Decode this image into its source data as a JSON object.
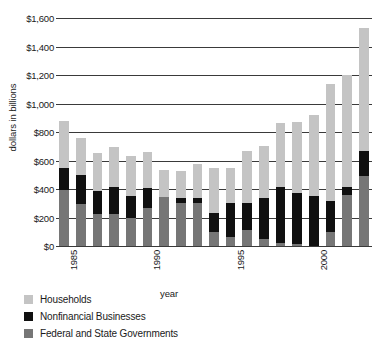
{
  "chart_data": {
    "type": "bar",
    "subtype": "stacked-bar",
    "title": "",
    "xlabel": "year",
    "ylabel": "dollars in billions",
    "ylim": [
      0,
      1600
    ],
    "ytick_values": [
      0,
      200,
      400,
      600,
      800,
      1000,
      1200,
      1400,
      1600
    ],
    "ytick_labels": [
      "$0",
      "$200",
      "$400",
      "$600",
      "$800",
      "$1,000",
      "$1,200",
      "$1,400",
      "$1,600"
    ],
    "grid": true,
    "legend_position": "below-left",
    "categories": [
      1985,
      1986,
      1987,
      1988,
      1989,
      1990,
      1991,
      1992,
      1993,
      1994,
      1995,
      1996,
      1997,
      1998,
      1999,
      2000,
      2001,
      2002,
      2003
    ],
    "xtick_labels": [
      "1985",
      "1990",
      "1995",
      "2000"
    ],
    "xtick_categories": [
      1985,
      1990,
      1995,
      2000
    ],
    "series": [
      {
        "name": "Federal and State Governments",
        "color": "#767676",
        "values": [
          390,
          295,
          225,
          225,
          200,
          270,
          345,
          305,
          300,
          100,
          65,
          115,
          50,
          20,
          15,
          0,
          95,
          355,
          490
        ]
      },
      {
        "name": "Nonfinancial Businesses",
        "color": "#101010",
        "values": [
          160,
          205,
          160,
          190,
          150,
          135,
          0,
          30,
          40,
          130,
          240,
          190,
          290,
          395,
          355,
          350,
          220,
          60,
          180
        ]
      },
      {
        "name": "Households",
        "color": "#c4c4c4",
        "values": [
          330,
          255,
          270,
          280,
          285,
          255,
          190,
          195,
          235,
          320,
          245,
          360,
          365,
          445,
          500,
          570,
          825,
          785,
          860
        ]
      }
    ],
    "totals": [
      880,
      755,
      655,
      695,
      635,
      660,
      535,
      530,
      575,
      550,
      550,
      665,
      705,
      860,
      870,
      920,
      1140,
      1200,
      1530
    ]
  },
  "legend": {
    "items": [
      {
        "label": "Households",
        "color": "#c4c4c4"
      },
      {
        "label": "Nonfinancial Businesses",
        "color": "#101010"
      },
      {
        "label": "Federal and State Governments",
        "color": "#767676"
      }
    ]
  }
}
